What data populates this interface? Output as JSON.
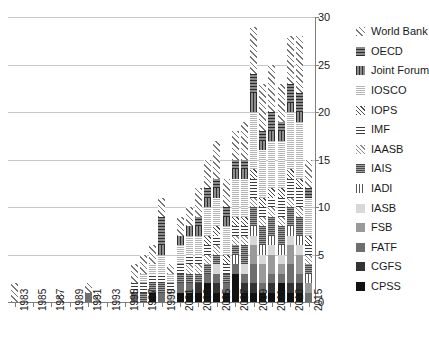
{
  "chart_data": {
    "type": "bar",
    "subtype": "stacked",
    "title": "",
    "xlabel": "",
    "ylabel": "",
    "ylim": [
      0,
      30
    ],
    "yticks": [
      0,
      5,
      10,
      15,
      20,
      25,
      30
    ],
    "grid": true,
    "legend_position": "right",
    "categories": [
      "1983",
      "1984",
      "1985",
      "1986",
      "1987",
      "1988",
      "1989",
      "1990",
      "1991",
      "1992",
      "1993",
      "1994",
      "1995",
      "1996",
      "1997",
      "1998",
      "1999",
      "2000",
      "2001",
      "2002",
      "2003",
      "2004",
      "2005",
      "2006",
      "2007",
      "2008",
      "2009",
      "2010",
      "2011",
      "2012",
      "2013",
      "2014",
      "2015"
    ],
    "xtick_labels": [
      "1983",
      "1985",
      "1987",
      "1989",
      "1991",
      "1993",
      "1995",
      "1997",
      "1999",
      "2001",
      "2003",
      "2005",
      "2007",
      "2009",
      "2011",
      "2013",
      "2015"
    ],
    "series": [
      {
        "name": "CPSS",
        "pattern": "p-cpss",
        "values": [
          0,
          0,
          0,
          0,
          0,
          0,
          0,
          0,
          0,
          0,
          0,
          0,
          0,
          0,
          0,
          1,
          0,
          0,
          1,
          1,
          1,
          2,
          1,
          1,
          3,
          1,
          1,
          1,
          1,
          2,
          1,
          1,
          0
        ]
      },
      {
        "name": "CGFS",
        "pattern": "p-cgfs",
        "values": [
          0,
          0,
          0,
          0,
          0,
          0,
          0,
          0,
          0,
          0,
          0,
          0,
          0,
          0,
          0,
          0,
          0,
          0,
          0,
          0,
          1,
          0,
          1,
          0,
          0,
          1,
          1,
          0,
          1,
          0,
          1,
          1,
          0
        ]
      },
      {
        "name": "FATF",
        "pattern": "p-fatf",
        "values": [
          0,
          0,
          0,
          0,
          0,
          0,
          0,
          0,
          1,
          0,
          0,
          0,
          0,
          1,
          0,
          0,
          1,
          0,
          1,
          1,
          0,
          1,
          1,
          1,
          1,
          1,
          2,
          1,
          1,
          1,
          2,
          1,
          1
        ]
      },
      {
        "name": "FSB",
        "pattern": "p-fsb",
        "values": [
          0,
          0,
          0,
          0,
          0,
          0,
          0,
          0,
          0,
          0,
          0,
          0,
          0,
          0,
          0,
          0,
          0,
          0,
          0,
          0,
          0,
          0,
          0,
          0,
          0,
          0,
          2,
          2,
          2,
          1,
          2,
          2,
          1
        ]
      },
      {
        "name": "IASB",
        "pattern": "p-iasb",
        "values": [
          0,
          0,
          0,
          0,
          0,
          0,
          0,
          0,
          0,
          0,
          0,
          0,
          0,
          0,
          0,
          0,
          0,
          1,
          0,
          0,
          0,
          0,
          1,
          0,
          0,
          1,
          1,
          1,
          1,
          1,
          1,
          1,
          0
        ]
      },
      {
        "name": "IADI",
        "pattern": "p-iadi",
        "values": [
          0,
          0,
          0,
          0,
          0,
          0,
          0,
          0,
          0,
          0,
          0,
          0,
          0,
          0,
          0,
          0,
          0,
          0,
          0,
          0,
          0,
          0,
          0,
          0,
          1,
          0,
          1,
          1,
          1,
          1,
          1,
          1,
          1
        ]
      },
      {
        "name": "IAIS",
        "pattern": "p-iais",
        "values": [
          0,
          0,
          0,
          0,
          0,
          0,
          0,
          0,
          0,
          0,
          0,
          0,
          0,
          0,
          1,
          1,
          1,
          0,
          1,
          1,
          1,
          1,
          1,
          1,
          1,
          2,
          2,
          2,
          2,
          2,
          2,
          2,
          1
        ]
      },
      {
        "name": "IAASB",
        "pattern": "p-iaasb",
        "values": [
          0,
          0,
          0,
          0,
          0,
          0,
          0,
          0,
          0,
          0,
          0,
          0,
          0,
          0,
          0,
          0,
          0,
          0,
          0,
          1,
          1,
          1,
          1,
          0,
          1,
          1,
          1,
          1,
          1,
          1,
          1,
          1,
          1
        ]
      },
      {
        "name": "IMF",
        "pattern": "p-imf",
        "values": [
          0,
          0,
          0,
          0,
          0,
          0,
          0,
          0,
          0,
          0,
          0,
          0,
          0,
          1,
          1,
          1,
          1,
          1,
          1,
          1,
          1,
          1,
          1,
          1,
          1,
          1,
          2,
          1,
          1,
          2,
          2,
          2,
          1
        ]
      },
      {
        "name": "IOPS",
        "pattern": "p-iops",
        "values": [
          0,
          0,
          0,
          0,
          0,
          0,
          0,
          0,
          0,
          0,
          0,
          0,
          0,
          0,
          0,
          0,
          0,
          0,
          0,
          0,
          0,
          1,
          1,
          1,
          1,
          1,
          1,
          1,
          1,
          1,
          1,
          1,
          1
        ]
      },
      {
        "name": "IOSCO",
        "pattern": "p-iosco",
        "values": [
          0,
          0,
          0,
          0,
          0,
          0,
          0,
          0,
          0,
          0,
          0,
          0,
          0,
          0,
          1,
          1,
          2,
          1,
          2,
          2,
          2,
          3,
          3,
          3,
          4,
          4,
          6,
          5,
          5,
          5,
          6,
          6,
          4
        ]
      },
      {
        "name": "Joint Forum",
        "pattern": "p-jointforum",
        "values": [
          0,
          0,
          0,
          0,
          0,
          0,
          0,
          0,
          0,
          0,
          0,
          0,
          0,
          0,
          0,
          0,
          1,
          0,
          1,
          1,
          1,
          1,
          1,
          1,
          1,
          1,
          2,
          1,
          1,
          1,
          1,
          1,
          0
        ]
      },
      {
        "name": "OECD",
        "pattern": "p-oecd",
        "values": [
          0,
          0,
          0,
          0,
          0,
          0,
          0,
          0,
          0,
          0,
          0,
          0,
          0,
          0,
          0,
          0,
          3,
          0,
          0,
          0,
          1,
          1,
          1,
          1,
          1,
          1,
          2,
          1,
          2,
          1,
          2,
          2,
          1
        ]
      },
      {
        "name": "World Bank",
        "pattern": "p-worldbank",
        "values": [
          2,
          0,
          0,
          0,
          0,
          1,
          0,
          0,
          1,
          1,
          0,
          0,
          0,
          2,
          2,
          2,
          2,
          1,
          2,
          2,
          3,
          3,
          4,
          3,
          3,
          4,
          5,
          5,
          5,
          4,
          5,
          6,
          3
        ]
      }
    ],
    "legend": [
      {
        "label": "World Bank",
        "pattern": "p-worldbank"
      },
      {
        "label": "OECD",
        "pattern": "p-oecd"
      },
      {
        "label": "Joint Forum",
        "pattern": "p-jointforum"
      },
      {
        "label": "IOSCO",
        "pattern": "p-iosco"
      },
      {
        "label": "IOPS",
        "pattern": "p-iops"
      },
      {
        "label": "IMF",
        "pattern": "p-imf"
      },
      {
        "label": "IAASB",
        "pattern": "p-iaasb"
      },
      {
        "label": "IAIS",
        "pattern": "p-iais"
      },
      {
        "label": "IADI",
        "pattern": "p-iadi"
      },
      {
        "label": "IASB",
        "pattern": "p-iasb"
      },
      {
        "label": "FSB",
        "pattern": "p-fsb"
      },
      {
        "label": "FATF",
        "pattern": "p-fatf"
      },
      {
        "label": "CGFS",
        "pattern": "p-cgfs"
      },
      {
        "label": "CPSS",
        "pattern": "p-cpss"
      }
    ],
    "colors": {
      "axis": "#7f7f7f",
      "grid": "#c8c8c8",
      "text": "#1a1a1a",
      "background": "#ffffff"
    }
  }
}
